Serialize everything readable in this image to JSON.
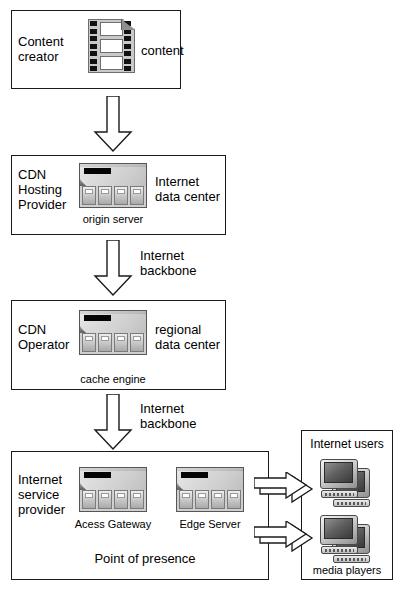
{
  "diagram": {
    "stroke_color": "#1a1a1a",
    "background_color": "#ffffff"
  },
  "nodes": {
    "content_creator": {
      "role_label": "Content\ncreator",
      "icon_caption": "content",
      "icon": "film-strip-icon"
    },
    "cdn_hosting_provider": {
      "role_label": "CDN\nHosting\nProvider",
      "site_label": "Internet\ndata center",
      "icon_caption": "origin server",
      "icon": "server-rack-icon"
    },
    "cdn_operator": {
      "role_label": "CDN\nOperator",
      "site_label": "regional\ndata center",
      "icon_caption": "cache engine",
      "icon": "server-rack-icon"
    },
    "internet_service_provider": {
      "role_label": "Internet\nservice\nprovider",
      "icon_caption_left": "Acess Gateway",
      "icon_caption_right": "Edge Server",
      "footer_label": "Point of presence",
      "icon_left": "server-rack-icon",
      "icon_right": "server-rack-icon"
    },
    "internet_users": {
      "title_label": "Internet users",
      "icon_caption": "media players",
      "icon": "monitor-pair-icon"
    }
  },
  "connectors": {
    "creator_to_hosting": {
      "kind": "down-block-arrow",
      "label": ""
    },
    "hosting_to_operator": {
      "kind": "down-block-arrow",
      "label": "Internet\nbackbone"
    },
    "operator_to_isp": {
      "kind": "down-block-arrow",
      "label": "Internet\nbackbone"
    },
    "isp_to_users_top": {
      "kind": "right-block-arrow",
      "label": ""
    },
    "isp_to_users_bottom": {
      "kind": "right-block-arrow",
      "label": ""
    }
  }
}
